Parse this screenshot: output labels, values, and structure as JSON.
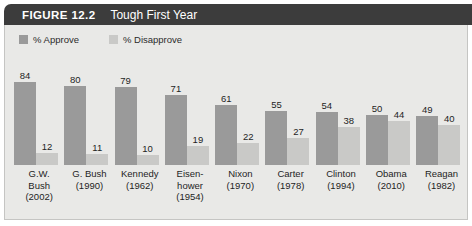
{
  "figure": {
    "number_label": "FIGURE 12.2",
    "title": "Tough First Year"
  },
  "legend": {
    "items": [
      {
        "label": "% Approve",
        "color": "#9a9a9a",
        "swatch_name": "legend-swatch-approve"
      },
      {
        "label": "% Disapprove",
        "color": "#c9c9c7",
        "swatch_name": "legend-swatch-disapprove"
      }
    ]
  },
  "chart_data": {
    "type": "bar",
    "title": "Tough First Year",
    "xlabel": "",
    "ylabel": "",
    "ylim": [
      0,
      100
    ],
    "grid": false,
    "legend_position": "top-left",
    "categories": [
      "G.W. Bush (2002)",
      "G. Bush (1990)",
      "Kennedy (1962)",
      "Eisenhower (1954)",
      "Nixon (1970)",
      "Carter (1978)",
      "Clinton (1994)",
      "Obama (2010)",
      "Reagan (1982)"
    ],
    "category_lines": [
      [
        "G.W.",
        "Bush",
        "(2002)"
      ],
      [
        "G. Bush",
        "(1990)"
      ],
      [
        "Kennedy",
        "(1962)"
      ],
      [
        "Eisen-",
        "hower",
        "(1954)"
      ],
      [
        "Nixon",
        "(1970)"
      ],
      [
        "Carter",
        "(1978)"
      ],
      [
        "Clinton",
        "(1994)"
      ],
      [
        "Obama",
        "(2010)"
      ],
      [
        "Reagan",
        "(1982)"
      ]
    ],
    "series": [
      {
        "name": "% Approve",
        "color": "#9a9a9a",
        "values": [
          84,
          80,
          79,
          71,
          61,
          55,
          54,
          50,
          49
        ]
      },
      {
        "name": "% Disapprove",
        "color": "#c9c9c7",
        "values": [
          12,
          11,
          10,
          19,
          22,
          27,
          38,
          44,
          40
        ]
      }
    ]
  },
  "colors": {
    "title_bar": "#3c3c3c",
    "panel_background": "#e9e9e7",
    "panel_border": "#c5c5c3",
    "approve": "#9a9a9a",
    "disapprove": "#c9c9c7",
    "text": "#1e1e1e"
  }
}
